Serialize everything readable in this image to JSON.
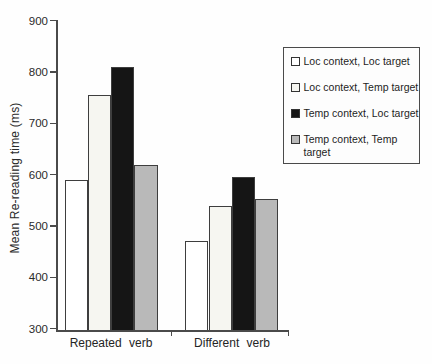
{
  "chart_data": {
    "type": "bar",
    "title": "",
    "categories": [
      "Repeated verb",
      "Different verb"
    ],
    "series": [
      {
        "name": "Loc context, Loc target",
        "values": [
          590,
          470
        ],
        "fill": "#ffffff"
      },
      {
        "name": "Loc context, Temp target",
        "values": [
          755,
          538
        ],
        "fill": "#f6f6f1"
      },
      {
        "name": "Temp context, Loc target",
        "values": [
          810,
          595
        ],
        "fill": "#151515"
      },
      {
        "name": "Temp context, Temp target",
        "values": [
          618,
          552
        ],
        "fill": "#b9b9b9"
      }
    ],
    "xlabel": "",
    "ylabel": "Mean Re-reading time (ms)",
    "ylim": [
      300,
      900
    ],
    "yticks": [
      300,
      400,
      500,
      600,
      700,
      800,
      900
    ],
    "grid": false,
    "legend_position": "upper right",
    "bar_border_color": "#3e3e3e",
    "axis_color": "#4a4a4a",
    "text_color": "#222222",
    "legend_border_color": "#4a4a4a"
  }
}
